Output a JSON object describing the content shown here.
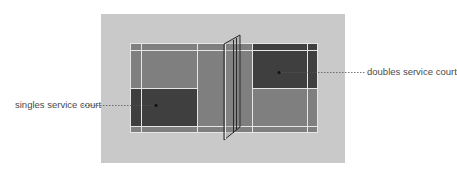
{
  "diagram": {
    "colors": {
      "page_background": "#ffffff",
      "surround": "#c9c9c9",
      "court": "#7f7f7f",
      "service_court_highlight": "#3f3f3f",
      "court_lines": "#e6e6e6",
      "net_outline": "#2a2a2a",
      "leader_line": "#555555",
      "label_text": "#4a4a4a"
    },
    "labels": {
      "singles": "singles service court",
      "doubles": "doubles service court"
    },
    "annotations": [
      {
        "id": "singles",
        "text": "singles service court",
        "side": "left",
        "anchor_x": 156,
        "anchor_y": 105
      },
      {
        "id": "doubles",
        "text": "doubles service court",
        "side": "right",
        "anchor_x": 279,
        "anchor_y": 72
      }
    ]
  }
}
